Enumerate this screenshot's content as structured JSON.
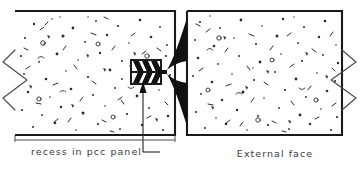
{
  "drawing": {
    "title": "Recess in PCC panel detail",
    "type": "technical-section-drawing",
    "canvas": {
      "width": 363,
      "height": 171
    },
    "colors": {
      "background": "#ffffff",
      "panel_outline": "#1a1a1a",
      "hatch_speckle": "#2b2b2b",
      "break_line": "#4a4a4a",
      "text": "#3a3a3a",
      "detail_black": "#111111"
    },
    "labels": [
      {
        "id": "recess-label",
        "text": "recess in pcc panel",
        "x": 31,
        "y": 155,
        "anchor": "start"
      },
      {
        "id": "external-face-label",
        "text": "External face",
        "x": 275,
        "y": 157,
        "anchor": "middle"
      }
    ],
    "panels": [
      {
        "id": "left-panel",
        "name": "pcc-panel-left",
        "x": 15,
        "y": 11,
        "width": 160,
        "height": 124,
        "hatch": "concrete-speckle"
      },
      {
        "id": "right-panel",
        "name": "pcc-panel-right",
        "x": 187,
        "y": 11,
        "width": 155,
        "height": 124,
        "hatch": "concrete-speckle"
      }
    ],
    "recess": {
      "id": "recess-detail",
      "x": 131,
      "y": 60,
      "width": 30,
      "height": 24,
      "chevron_count": 3,
      "description": "recess opening with chevron barb hatching"
    },
    "flare": {
      "id": "flare-detail",
      "pinch_x": 168,
      "pinch_y": 72,
      "top_y": 22,
      "bottom_y": 122,
      "right_x": 187,
      "description": "trumpet flare joining recess to external face"
    },
    "break_lines": [
      {
        "id": "break-left",
        "side": "left",
        "x": 15,
        "y_center": 80
      },
      {
        "id": "break-right",
        "side": "right",
        "x": 342,
        "y_center": 80
      }
    ],
    "leader": {
      "id": "recess-leader",
      "from_x": 143,
      "from_y": 152,
      "to_x": 143,
      "to_y": 84,
      "elbow_x": 160,
      "elbow_y": 152,
      "has_arrowhead": true
    }
  }
}
